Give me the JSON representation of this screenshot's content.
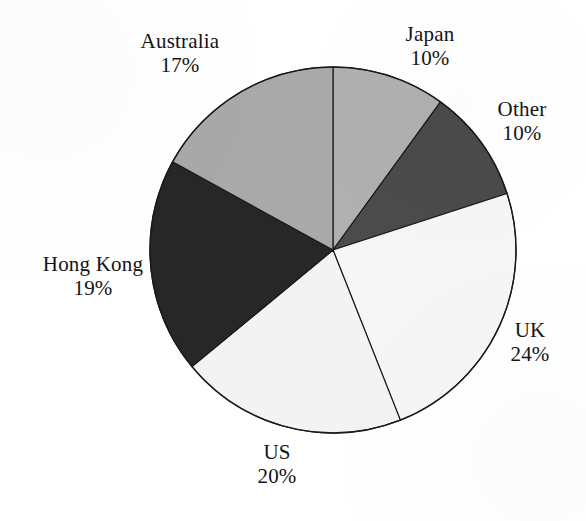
{
  "chart_data": {
    "type": "pie",
    "title": "",
    "subtitle": "",
    "xlabel": "",
    "ylabel": "",
    "legend_position": "none",
    "grid": false,
    "labels_show_percent": true,
    "start_angle_deg": 0,
    "direction": "clockwise",
    "center": {
      "x": 333,
      "y": 250
    },
    "radius": 183,
    "categories": [
      "Japan",
      "Other",
      "UK",
      "US",
      "Hong Kong",
      "Australia"
    ],
    "values": [
      10,
      10,
      24,
      20,
      19,
      17
    ],
    "slices": [
      {
        "name": "Japan",
        "label": "Japan",
        "value": 10,
        "value_text": "10%",
        "color": "#b0b0b0",
        "start_deg": 0,
        "end_deg": 36
      },
      {
        "name": "Other",
        "label": "Other",
        "value": 10,
        "value_text": "10%",
        "color": "#4b4b4b",
        "start_deg": 36,
        "end_deg": 72
      },
      {
        "name": "UK",
        "label": "UK",
        "value": 24,
        "value_text": "24%",
        "color": "#f6f6f6",
        "start_deg": 72,
        "end_deg": 158.4
      },
      {
        "name": "US",
        "label": "US",
        "value": 20,
        "value_text": "20%",
        "color": "#f3f3f3",
        "start_deg": 158.4,
        "end_deg": 230.4
      },
      {
        "name": "Hong Kong",
        "label": "Hong Kong",
        "value": 19,
        "value_text": "19%",
        "color": "#272727",
        "start_deg": 230.4,
        "end_deg": 298.8
      },
      {
        "name": "Australia",
        "label": "Australia",
        "value": 17,
        "value_text": "17%",
        "color": "#a9a9a9",
        "start_deg": 298.8,
        "end_deg": 360
      }
    ],
    "outline_color": "#1a1a1a",
    "background_color": "#ffffff",
    "text_color": "#141414"
  }
}
